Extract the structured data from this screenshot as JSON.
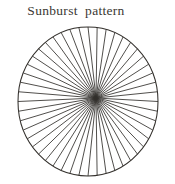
{
  "page": {
    "background_color": "#ffffff",
    "width": 175,
    "height": 184
  },
  "figure": {
    "title": "Sunburst  pattern",
    "title_color": "#3b3833",
    "caption_position": "top"
  },
  "chart_data": {
    "type": "line",
    "title": "Sunburst  pattern",
    "subtitle": "",
    "xlabel": "",
    "ylabel": "",
    "grid": false,
    "legend": null,
    "geometry": {
      "shape": "ellipse",
      "center_x": 88,
      "center_y": 101.5,
      "radius_x": 70,
      "radius_y": 74.5,
      "outline_stroke": "#33302c",
      "outline_width": 1.05
    },
    "hub": {
      "x": 96,
      "y": 98,
      "label": "convergence point",
      "offset_from_center_x": 8,
      "offset_from_center_y": -3.5
    },
    "rays": {
      "count": 48,
      "start_angle_deg": -90,
      "spacing_deg": 7.5,
      "stroke": "#322f2c",
      "stroke_width": 0.85,
      "endpoints_on": "circumference",
      "converge_at": "hub"
    }
  }
}
